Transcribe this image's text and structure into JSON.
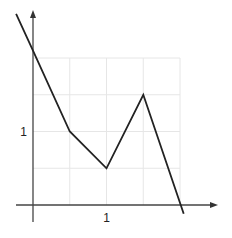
{
  "chart_data": {
    "type": "line",
    "title": "",
    "xlabel": "",
    "ylabel": "",
    "x_ticks": [
      {
        "value": 1,
        "label": "1"
      }
    ],
    "y_ticks": [
      {
        "value": 1,
        "label": "1"
      }
    ],
    "grid": true,
    "grid_step": 0.5,
    "xlim": [
      -0.45,
      2.6
    ],
    "ylim": [
      -0.45,
      2.8
    ],
    "legend": null,
    "series": [
      {
        "name": "piecewise-linear",
        "x": [
          -0.23,
          0,
          0.5,
          1.0,
          1.5,
          2.05
        ],
        "y": [
          2.6,
          2.1,
          1.0,
          0.5,
          1.5,
          -0.12
        ]
      }
    ],
    "colors": {
      "line": "#222222",
      "axis": "#444444",
      "grid": "#e6e6e6"
    }
  }
}
